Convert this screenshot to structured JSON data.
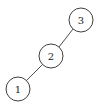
{
  "diagram": {
    "type": "tree",
    "nodes": [
      {
        "id": "3",
        "label": "3",
        "cx": 81,
        "cy": 20,
        "r": 12
      },
      {
        "id": "2",
        "label": "2",
        "cx": 51,
        "cy": 56,
        "r": 12
      },
      {
        "id": "1",
        "label": "1",
        "cx": 18,
        "cy": 89,
        "r": 12
      }
    ],
    "edges": [
      {
        "from": "3",
        "to": "2"
      },
      {
        "from": "2",
        "to": "1"
      }
    ],
    "colors": {
      "stroke": "#2a2a2a",
      "background": "#ffffff"
    }
  }
}
